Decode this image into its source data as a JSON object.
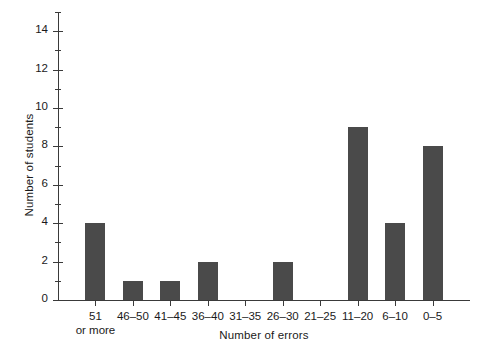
{
  "chart_data": {
    "type": "bar",
    "title": "",
    "subtitle": "",
    "xlabel": "Number of errors",
    "ylabel": "Number of students",
    "categories": [
      "51\nor more",
      "46–50",
      "41–45",
      "36–40",
      "31–35",
      "26–30",
      "21–25",
      "11–20",
      "6–10",
      "0–5"
    ],
    "category_labels": [
      {
        "line1": "51",
        "line2": "or more"
      },
      {
        "line1": "46–50",
        "line2": ""
      },
      {
        "line1": "41–45",
        "line2": ""
      },
      {
        "line1": "36–40",
        "line2": ""
      },
      {
        "line1": "31–35",
        "line2": ""
      },
      {
        "line1": "26–30",
        "line2": ""
      },
      {
        "line1": "21–25",
        "line2": ""
      },
      {
        "line1": "11–20",
        "line2": ""
      },
      {
        "line1": "6–10",
        "line2": ""
      },
      {
        "line1": "0–5",
        "line2": ""
      }
    ],
    "values": [
      4,
      1,
      1,
      2,
      0,
      2,
      0,
      9,
      4,
      8
    ],
    "ylim": [
      0,
      15
    ],
    "ytick_labels": [
      "0",
      "2",
      "4",
      "6",
      "8",
      "10",
      "12",
      "14"
    ],
    "ytick_values": [
      0,
      2,
      4,
      6,
      8,
      10,
      12,
      14
    ],
    "yminor_values": [
      1,
      3,
      5,
      7,
      9,
      11,
      13,
      15
    ],
    "grid": false,
    "legend": null,
    "bar_color": "#4a4a4a",
    "axis_color": "#3a3a3a",
    "background": "#ffffff"
  }
}
